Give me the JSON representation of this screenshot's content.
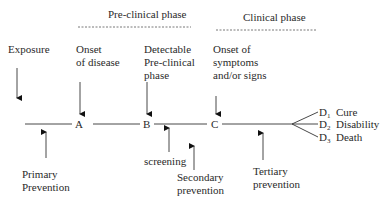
{
  "phases": {
    "preclinical": "Pre-clinical phase",
    "clinical": "Clinical phase"
  },
  "events": {
    "exposure": "Exposure",
    "onset_disease": "Onset\nof disease",
    "detectable": "Detectable\nPre-clinical\nphase",
    "onset_symptoms": "Onset of\nsymptoms\nand/or signs"
  },
  "nodes": {
    "a": "A",
    "b": "B",
    "c": "C"
  },
  "outcomes": [
    {
      "code": "D",
      "sub": "1",
      "label": "Cure"
    },
    {
      "code": "D",
      "sub": "2",
      "label": "Disability"
    },
    {
      "code": "D",
      "sub": "3",
      "label": "Death"
    }
  ],
  "prevention": {
    "primary": "Primary\nPrevention",
    "screening": "screening",
    "secondary": "Secondary\nprevention",
    "tertiary": "Tertiary\nprevention"
  }
}
